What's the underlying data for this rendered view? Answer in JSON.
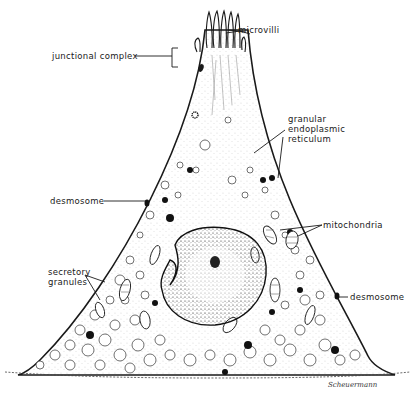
{
  "figure": {
    "colors": {
      "ink": "#1a1a1a",
      "background": "#ffffff",
      "stipple": "#555555"
    }
  },
  "labels": {
    "microvilli": "microvilli",
    "junctional_complex": "junctional complex",
    "granular_er": [
      "granular",
      "endoplasmic",
      "reticulum"
    ],
    "desmosome_left": "desmosome",
    "mitochondria": "mitochondria",
    "secretory_granules": [
      "secretory",
      "granules"
    ],
    "desmosome_right": "desmosome"
  },
  "signature": "Scheuermann"
}
